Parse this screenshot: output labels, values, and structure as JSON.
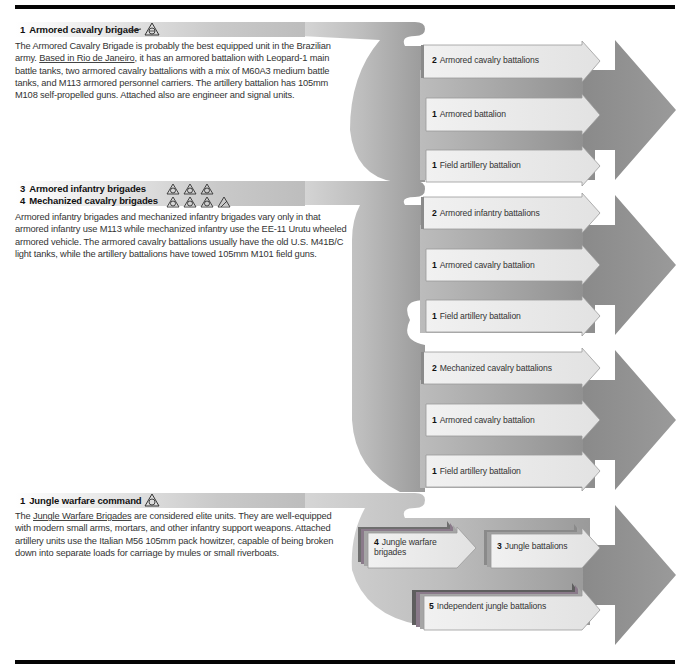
{
  "sections": [
    {
      "header": {
        "count": "1",
        "title": "Armored cavalry brigade",
        "insignia": [
          "cavalry-stroke-icon",
          "triangle-brigade-icon"
        ]
      },
      "body_parts": [
        {
          "text": "The Armored Cavalry Brigade is probably the best equipped unit in the Brazilian army. "
        },
        {
          "text": "Based in Rio de Janeiro",
          "underlined": true
        },
        {
          "text": ", it has an armored battalion with Leopard-1 main battle tanks, two armored cavalry battalions with a mix of M60A3 medium battle tanks, and M113 armored personnel carriers. The artillery battalion has 105mm M108 self-propelled guns. Attached also are engineer and signal units."
        }
      ],
      "body_lines": [
        "The Armored Cavalry Brigade is probably the best equipped unit in the Brazilian",
        "army. |Based in Rio de Janeiro|, it has an armored battalion with Leopard-1 main",
        "battle tanks, two armored cavalry battalions with a mix of M60A3 medium battle",
        "tanks, and M113 armored personnel carriers. The artillery battalion has 105mm",
        "M108 self-propelled guns. Attached also are engineer and signal units."
      ],
      "units": [
        {
          "count": "2",
          "label": "Armored cavalry battalions"
        },
        {
          "count": "1",
          "label": "Armored battalion"
        },
        {
          "count": "1",
          "label": "Field artillery battalion"
        }
      ]
    },
    {
      "headers": [
        {
          "count": "3",
          "title": "Armored infantry brigades",
          "insignia_count": 3
        },
        {
          "count": "4",
          "title": "Mechanized cavalry brigades",
          "insignia_count": 4
        }
      ],
      "body_lines": [
        "Armored infantry brigades and mechanized infantry brigades vary only in that",
        "armored infantry use M113 while mechanized infantry use the EE-11 Urutu wheeled",
        "armored vehicle. The armored cavalry battalions usually have the old U.S. M41B/C",
        "light tanks, while the artillery battalions have towed 105mm M101 field guns."
      ],
      "units_infantry": [
        {
          "count": "2",
          "label": "Armored infantry battalions"
        },
        {
          "count": "1",
          "label": "Armored cavalry battalion"
        },
        {
          "count": "1",
          "label": "Field artillery battalion"
        }
      ],
      "units_mechanized": [
        {
          "count": "2",
          "label": "Mechanized cavalry battalions"
        },
        {
          "count": "1",
          "label": "Armored cavalry battalion"
        },
        {
          "count": "1",
          "label": "Field artillery battalion"
        }
      ]
    },
    {
      "header": {
        "count": "1",
        "title": "Jungle warfare command",
        "insignia": [
          "triangle-brigade-icon"
        ]
      },
      "body_lines": [
        "The |Jungle Warfare Brigades| are considered elite units. They are well-equipped",
        "with modern small arms, mortars, and other infantry support weapons. Attached",
        "artillery units use the Italian M56 105mm pack howitzer, capable of being broken",
        "down into separate loads for carriage by mules or small riverboats."
      ],
      "units": [
        {
          "count": "4",
          "label_line1": "Jungle warfare",
          "label_line2": "brigades"
        },
        {
          "count": "3",
          "label": "Jungle battalions"
        },
        {
          "count": "5",
          "label": "Independent jungle battalions"
        }
      ]
    }
  ],
  "colors": {
    "rule": "#050505",
    "swoosh_light": "#c8c8c8",
    "swoosh_dark": "#8a8a8a",
    "big_arrow": "#8c8c8c",
    "unit_arrow_fill": "#ececec",
    "unit_arrow_edge": "#8f8f8f"
  }
}
